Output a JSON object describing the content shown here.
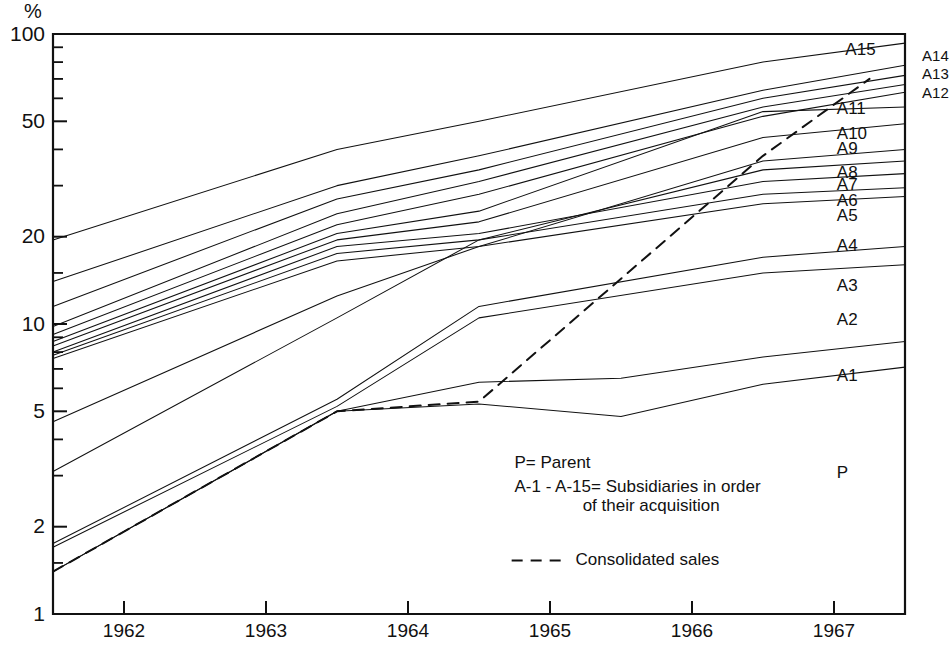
{
  "chart_data": {
    "type": "line",
    "title": "",
    "subtitle": "",
    "xlabel": "",
    "ylabel": "%",
    "yscale": "log",
    "ylim": [
      1,
      100
    ],
    "xlim": [
      1961.5,
      1967.5
    ],
    "grid": false,
    "legend_position": "inside-center",
    "y_major_ticks": [
      1,
      2,
      5,
      10,
      20,
      50,
      100
    ],
    "y_major_tick_labels": [
      "1",
      "2",
      "5",
      "10",
      "20",
      "50",
      "100"
    ],
    "y_minor_ticks": [
      1.5,
      3,
      4,
      6,
      7,
      8,
      9,
      15,
      30,
      40,
      60,
      70,
      80,
      90
    ],
    "x_tick_values": [
      1962.0,
      1963.0,
      1964.0,
      1965.0,
      1966.0,
      1967.0
    ],
    "x_tick_labels": [
      "1962",
      "1963",
      "1964",
      "1965",
      "1966",
      "1967"
    ],
    "x_label_positions": [
      1962.0,
      1963.0,
      1964.0,
      1965.0,
      1966.0,
      1967.0
    ],
    "series": [
      {
        "name": "A15",
        "label": "A15",
        "style": "solid",
        "label_placement": "inside",
        "label_x": 1967.08,
        "label_y": 88,
        "x": [
          1961.5,
          1963.5,
          1964.5,
          1966.5,
          1967.5
        ],
        "values": [
          19.5,
          40.0,
          50.0,
          80.0,
          93.0
        ]
      },
      {
        "name": "A14",
        "label": "A14",
        "style": "solid",
        "label_placement": "outside",
        "label_x": 1967.62,
        "label_y": 83,
        "x": [
          1961.5,
          1963.5,
          1964.5,
          1966.5,
          1967.5
        ],
        "values": [
          14.0,
          30.0,
          38.0,
          64.0,
          78.0
        ]
      },
      {
        "name": "A13",
        "label": "A13",
        "style": "solid",
        "label_placement": "outside",
        "label_x": 1967.62,
        "label_y": 72,
        "x": [
          1961.5,
          1963.5,
          1964.5,
          1966.5,
          1967.5
        ],
        "values": [
          11.5,
          27.0,
          34.0,
          60.0,
          72.0
        ]
      },
      {
        "name": "A12",
        "label": "A12",
        "style": "solid",
        "label_placement": "outside",
        "label_x": 1967.62,
        "label_y": 62,
        "x": [
          1961.5,
          1963.5,
          1964.5,
          1966.5,
          1967.5
        ],
        "values": [
          9.8,
          24.0,
          31.0,
          56.0,
          67.0
        ]
      },
      {
        "name": "A11",
        "label": "A11",
        "style": "solid",
        "label_placement": "inside",
        "label_x": 1967.02,
        "label_y": 55,
        "x": [
          1961.5,
          1963.5,
          1964.5,
          1966.5,
          1967.5
        ],
        "values": [
          9.2,
          22.0,
          28.0,
          52.0,
          63.0
        ]
      },
      {
        "name": "A10",
        "label": "A10",
        "style": "solid",
        "label_placement": "inside",
        "label_x": 1967.02,
        "label_y": 45,
        "x": [
          1961.5,
          1963.5,
          1964.5,
          1966.5,
          1967.5
        ],
        "values": [
          8.7,
          20.5,
          24.5,
          54.0,
          56.0
        ]
      },
      {
        "name": "A9",
        "label": "A9",
        "style": "solid",
        "label_placement": "inside",
        "label_x": 1967.02,
        "label_y": 40,
        "x": [
          1961.5,
          1963.5,
          1964.5,
          1966.5,
          1967.5
        ],
        "values": [
          8.4,
          19.5,
          22.5,
          44.0,
          49.0
        ]
      },
      {
        "name": "A8",
        "label": "A8",
        "style": "solid",
        "label_placement": "inside",
        "label_x": 1967.02,
        "label_y": 33,
        "x": [
          1961.5,
          1963.5,
          1964.5,
          1966.5,
          1967.5
        ],
        "values": [
          4.6,
          12.5,
          18.5,
          36.5,
          40.0
        ]
      },
      {
        "name": "A7",
        "label": "A7",
        "style": "solid",
        "label_placement": "inside",
        "label_x": 1967.02,
        "label_y": 30,
        "x": [
          1961.5,
          1963.5,
          1964.5,
          1966.5,
          1967.5
        ],
        "values": [
          3.1,
          10.5,
          19.5,
          34.0,
          36.5
        ]
      },
      {
        "name": "A6",
        "label": "A6",
        "style": "solid",
        "label_placement": "inside",
        "label_x": 1967.02,
        "label_y": 26.5,
        "x": [
          1961.5,
          1963.5,
          1964.5,
          1966.5,
          1967.5
        ],
        "values": [
          8.0,
          18.5,
          20.5,
          31.0,
          33.0
        ]
      },
      {
        "name": "A5",
        "label": "A5",
        "style": "solid",
        "label_placement": "inside",
        "label_x": 1967.02,
        "label_y": 23.5,
        "x": [
          1961.5,
          1963.5,
          1964.5,
          1966.5,
          1967.5
        ],
        "values": [
          7.8,
          17.5,
          19.5,
          28.0,
          29.5
        ]
      },
      {
        "name": "A4",
        "label": "A4",
        "style": "solid",
        "label_placement": "inside",
        "label_x": 1967.02,
        "label_y": 18.5,
        "x": [
          1961.5,
          1963.5,
          1964.5,
          1966.5,
          1967.5
        ],
        "values": [
          7.6,
          16.5,
          18.5,
          26.0,
          27.5
        ]
      },
      {
        "name": "A3",
        "label": "A3",
        "style": "solid",
        "label_placement": "inside",
        "label_x": 1967.02,
        "label_y": 13.5,
        "x": [
          1961.5,
          1963.5,
          1964.5,
          1966.5,
          1967.5
        ],
        "values": [
          1.75,
          5.5,
          11.5,
          17.0,
          18.5
        ]
      },
      {
        "name": "A2",
        "label": "A2",
        "style": "solid",
        "label_placement": "inside",
        "label_x": 1967.02,
        "label_y": 10.3,
        "x": [
          1961.5,
          1963.5,
          1964.5,
          1966.5,
          1967.5
        ],
        "values": [
          1.7,
          5.2,
          10.5,
          15.0,
          16.0
        ]
      },
      {
        "name": "A1",
        "label": "A1",
        "style": "solid",
        "label_placement": "inside",
        "label_x": 1967.02,
        "label_y": 6.6,
        "x": [
          1961.5,
          1963.5,
          1964.5,
          1965.5,
          1966.5,
          1967.5
        ],
        "values": [
          1.4,
          5.0,
          6.3,
          6.5,
          7.7,
          8.7
        ]
      },
      {
        "name": "P",
        "label": "P",
        "style": "solid",
        "label_placement": "inside",
        "label_x": 1967.02,
        "label_y": 3.05,
        "x": [
          1961.5,
          1963.5,
          1964.5,
          1965.5,
          1966.5,
          1967.5
        ],
        "values": [
          1.4,
          5.0,
          5.3,
          4.8,
          6.2,
          7.1
        ]
      },
      {
        "name": "consolidated",
        "label": "",
        "style": "dashed",
        "label_placement": "none",
        "x": [
          1961.5,
          1963.5,
          1964.5,
          1966.5,
          1967.25
        ],
        "values": [
          1.4,
          5.0,
          5.4,
          38.0,
          70.0
        ]
      }
    ],
    "annotations": [
      {
        "id": "legend-parent",
        "text": "P= Parent",
        "x": 1964.75,
        "y": 3.3
      },
      {
        "id": "legend-subsidiaries-line1",
        "text": "A-1 - A-15= Subsidiaries in order",
        "x": 1964.75,
        "y": 2.72
      },
      {
        "id": "legend-subsidiaries-line2",
        "text": "of their acquisition",
        "x": 1965.23,
        "y": 2.35
      },
      {
        "id": "legend-consolidated",
        "text": "Consolidated sales",
        "x": 1965.18,
        "y": 1.53
      }
    ],
    "legend_dash_sample": {
      "x_start": 1964.73,
      "x_end": 1965.08,
      "y": 1.53
    }
  }
}
